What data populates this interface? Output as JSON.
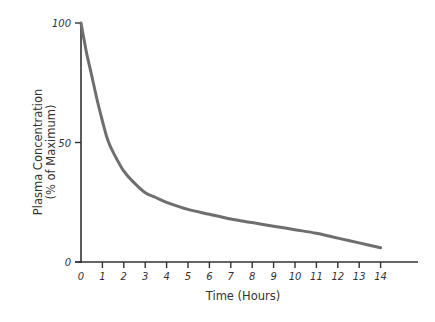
{
  "chart_data": {
    "type": "line",
    "title": "",
    "xlabel": "Time (Hours)",
    "ylabel": "Plasma Concentration (% of Maximum)",
    "ylabel_lines": [
      "Plasma Concentration",
      "(% of Maximum)"
    ],
    "xlim": [
      0,
      15
    ],
    "ylim": [
      0,
      100
    ],
    "xticks": [
      0,
      1,
      2,
      3,
      4,
      5,
      6,
      7,
      8,
      9,
      10,
      11,
      12,
      13,
      14
    ],
    "yticks": [
      0,
      50,
      100
    ],
    "grid": false,
    "legend": null,
    "series": [
      {
        "name": "Plasma concentration",
        "color": "#6e6e6e",
        "x": [
          0,
          0.25,
          0.5,
          0.75,
          1,
          1.25,
          1.5,
          2,
          2.5,
          3,
          3.5,
          4,
          5,
          6,
          7,
          8,
          9,
          10,
          11,
          12,
          13,
          14
        ],
        "y": [
          100,
          88,
          78,
          68,
          59,
          51,
          46,
          38,
          33,
          29,
          27,
          25,
          22,
          20,
          18,
          16.5,
          15,
          13.5,
          12,
          10,
          8,
          6
        ]
      }
    ]
  },
  "colors": {
    "axis": "#333333",
    "line": "#6e6e6e",
    "background": "#ffffff"
  }
}
